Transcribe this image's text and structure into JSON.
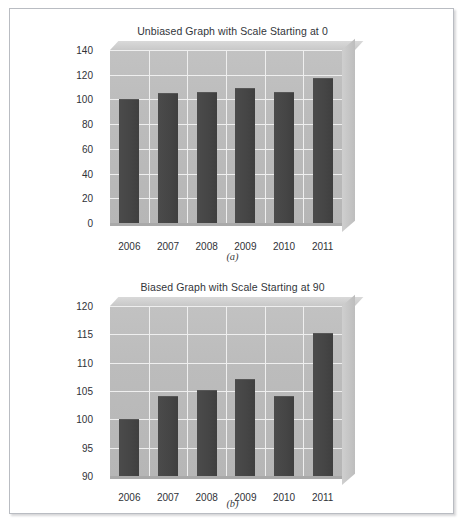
{
  "figure": {
    "caption_a": "(a)",
    "caption_b": "(b)"
  },
  "colors": {
    "bar": "#474747",
    "plot_background": "#bcbcbc",
    "gridline": "#efefef",
    "frame_border": "#b9bcc2",
    "text": "#2f3237"
  },
  "chart_data": [
    {
      "type": "bar",
      "id": "a",
      "title": "Unbiased Graph with Scale Starting at 0",
      "caption": "(a)",
      "categories": [
        "2006",
        "2007",
        "2008",
        "2009",
        "2010",
        "2011"
      ],
      "values": [
        100,
        105,
        106,
        109,
        106,
        117
      ],
      "xlabel": "",
      "ylabel": "",
      "ylim": [
        0,
        140
      ],
      "ytick_step": 20,
      "yticks": [
        0,
        20,
        40,
        60,
        80,
        100,
        120,
        140
      ],
      "ytick_labels": [
        "0",
        "20",
        "40",
        "60",
        "80",
        "100",
        "120",
        "140"
      ],
      "grid": true,
      "legend": "none",
      "style": "3d-column"
    },
    {
      "type": "bar",
      "id": "b",
      "title": "Biased Graph with Scale Starting at 90",
      "caption": "(b)",
      "categories": [
        "2006",
        "2007",
        "2008",
        "2009",
        "2010",
        "2011"
      ],
      "values": [
        100,
        104.2,
        105.2,
        107.2,
        104.2,
        115.3
      ],
      "xlabel": "",
      "ylabel": "",
      "ylim": [
        90,
        120
      ],
      "ytick_step": 5,
      "yticks": [
        90,
        95,
        100,
        105,
        110,
        115,
        120
      ],
      "ytick_labels": [
        "90",
        "95",
        "100",
        "105",
        "110",
        "115",
        "120"
      ],
      "grid": true,
      "legend": "none",
      "style": "3d-column"
    }
  ]
}
